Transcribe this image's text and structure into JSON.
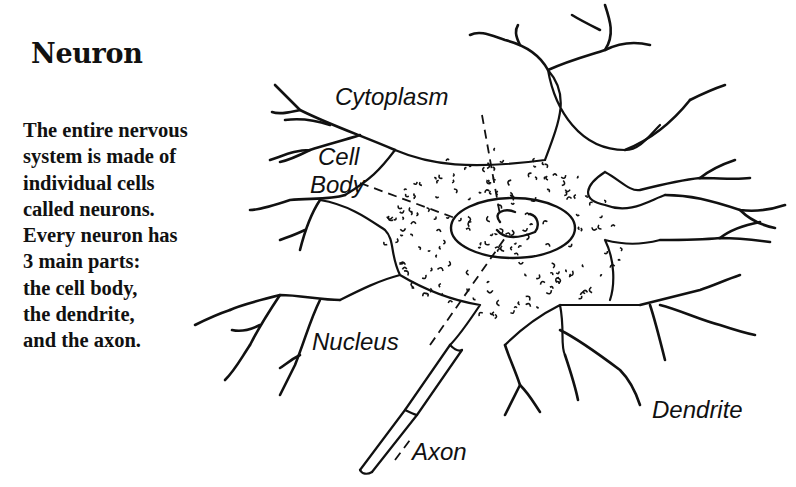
{
  "title": "Neuron",
  "description": {
    "lines": [
      "The entire nervous",
      "system is made of",
      "individual cells",
      "called neurons.",
      "Every neuron has",
      "3 main parts:",
      "the cell body,",
      "the dendrite,",
      "and the axon."
    ]
  },
  "diagram": {
    "labels": {
      "cytoplasm": "Cytoplasm",
      "cell_body_line1": "Cell",
      "cell_body_line2": "Body",
      "nucleus": "Nucleus",
      "dendrite": "Dendrite",
      "axon": "Axon"
    },
    "colors": {
      "ink": "#111111",
      "background": "#ffffff"
    }
  }
}
